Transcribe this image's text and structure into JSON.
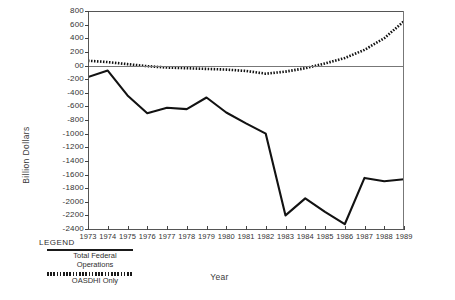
{
  "chart_data": {
    "type": "line",
    "title": "",
    "xlabel": "Year",
    "ylabel": "Billion Dollars",
    "x": [
      1973,
      1974,
      1975,
      1976,
      1977,
      1978,
      1979,
      1980,
      1981,
      1982,
      1983,
      1984,
      1985,
      1986,
      1987,
      1988,
      1989
    ],
    "xtick_labels": [
      "1973",
      "1974",
      "1975",
      "1976",
      "1977",
      "1978",
      "1979",
      "1980",
      "1981",
      "1982",
      "1983",
      "1984",
      "1985",
      "1986",
      "1987",
      "1988",
      "1989"
    ],
    "ytick_labels": [
      "800",
      "600",
      "400",
      "200",
      "00",
      "-200",
      "-400",
      "-600",
      "-800",
      "-1000",
      "-1200",
      "-1400",
      "-1600",
      "-1800",
      "-2000",
      "-2200",
      "-2400"
    ],
    "ytick_values": [
      800,
      600,
      400,
      200,
      0,
      -200,
      -400,
      -600,
      -800,
      -1000,
      -1200,
      -1400,
      -1600,
      -1800,
      -2000,
      -2200,
      -2400
    ],
    "ylim": [
      -2400,
      800
    ],
    "xlim": [
      1973,
      1989
    ],
    "grid": false,
    "legend_position": "below-left",
    "series": [
      {
        "name": "Total Federal Operations",
        "style": "solid",
        "values": [
          -170,
          -75,
          -440,
          -700,
          -620,
          -640,
          -470,
          -690,
          -850,
          -1000,
          -2200,
          -1950,
          -2150,
          -2330,
          -1650,
          -1700,
          -1670
        ]
      },
      {
        "name": "OASDHI Only",
        "style": "dotted",
        "values": [
          70,
          50,
          20,
          -10,
          -30,
          -40,
          -50,
          -60,
          -80,
          -120,
          -90,
          -40,
          30,
          110,
          230,
          400,
          650
        ]
      }
    ]
  },
  "legend": {
    "title": "LEGEND",
    "entries": [
      {
        "label": "Total Federal\nOperations",
        "label_line1": "Total Federal",
        "label_line2": "Operations",
        "style": "solid"
      },
      {
        "label": "OASDHI Only",
        "label_line1": "OASDHI Only",
        "label_line2": "",
        "style": "dotted"
      }
    ]
  },
  "axes": {
    "y_title": "Billion Dollars",
    "x_title": "Year"
  },
  "colors": {
    "line": "#121212",
    "axis": "#555555",
    "text": "#2a2a2a",
    "background": "#ffffff"
  }
}
